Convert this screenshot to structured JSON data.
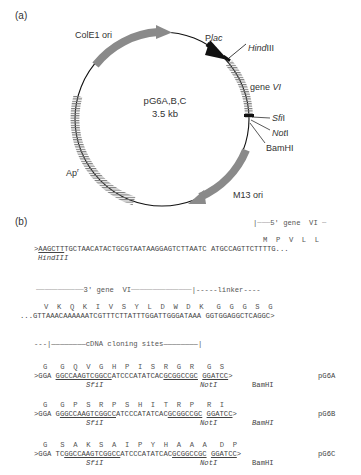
{
  "panel_a": {
    "label": "(a)",
    "plasmid": {
      "name": "pG6A,B,C",
      "size": "3.5 kb",
      "features": [
        {
          "name": "ColE1 ori",
          "type": "origin",
          "color": "#8c8c8c"
        },
        {
          "name": "Plac",
          "prefix": "P",
          "italic": "lac",
          "type": "promoter",
          "color": "#111111"
        },
        {
          "name": "HindIII",
          "italic": "Hind",
          "suffix": "III",
          "type": "restriction-site"
        },
        {
          "name": "gene VI",
          "prefix": "gene ",
          "italic": "VI",
          "type": "gene"
        },
        {
          "name": "SfiI",
          "italic": "Sfi",
          "suffix": "I",
          "type": "restriction-site"
        },
        {
          "name": "NotI",
          "italic": "Not",
          "suffix": "I",
          "type": "restriction-site"
        },
        {
          "name": "BamHI",
          "type": "restriction-site"
        },
        {
          "name": "M13 ori",
          "type": "origin",
          "color": "#8c8c8c"
        },
        {
          "name": "Apr",
          "prefix": "Ap",
          "superscript": "r",
          "type": "resistance-gene"
        }
      ]
    }
  },
  "panel_b": {
    "label": "(b)",
    "gene_vi_5_header": "|┈┈┈5' gene  VI ┈",
    "row1": {
      "aa": "M  P  V  L  L",
      "seq_prefix": ">",
      "hind_site": "AAGCTT",
      "seq_rest": "TGCTAACATACTGCGTAATAAGGAGTCTTAATC",
      "seq_gene": "ATGCCAGTTCTTTTG...",
      "site_label": "HindIII"
    },
    "gene_vi_3_header": "┈┈┈┈┈┈┈┈┈┈┈3' gene  VI┈┈┈┈┈┈┈┈┈┈┈┈┈┈|-----linker----",
    "row2": {
      "aa": "V  K  Q  K  I  V  S  Y  L  D  W  D  K   G  G  G  S  G",
      "seq": "...GTTAAACAAAAAATCGTTTCTTATTTGGATTGGGATAAA GGTGGAGGCTCAGGC>"
    },
    "cloning_header": "---|————————cDNA cloning sites————————|",
    "variants": [
      {
        "name": "pG6A",
        "aa": "G   G  Q  V  G  H  P  I  S  R  G  R   G  S",
        "seq_start": ">GGA ",
        "sfi": "GGCCAAGTCGGCC",
        "mid": "ATCCCATATCAC",
        "not": "GCGGCCGC",
        "gap": " ",
        "bam": "GGATCC",
        "end": ">",
        "pre_sfi": "",
        "labels": {
          "sfi": "SfiI",
          "not": "NotI",
          "bam": "BamHI"
        }
      },
      {
        "name": "pG6B",
        "aa": "G   G  P  S  R  P  S  H  I  T  R  P   R  I",
        "seq_start": ">GGA ",
        "pre_sfi": "G",
        "sfi": "GGCCAAGTCGGCC",
        "mid": "ATCCCATATCAC",
        "not": "GCGGCCGC",
        "gap": " ",
        "bam": "GGATCC",
        "end": ">",
        "labels": {
          "sfi": "SfiI",
          "not": "NotI",
          "bam": "BamHI"
        }
      },
      {
        "name": "pG6C",
        "aa": "G   S  A  K  S  A  I  P  Y  H  A  A  A   D  P",
        "seq_start": ">GGA ",
        "pre_sfi": "TC",
        "sfi": "GGCCAAGTCGGCC",
        "mid": "ATCCCATATCAC",
        "not": "GCGGCCGC",
        "gap": " ",
        "bam": "GGATCC",
        "end": ">",
        "labels": {
          "sfi": "SfiI",
          "not": "NotI",
          "bam": "BamHI"
        }
      }
    ]
  }
}
